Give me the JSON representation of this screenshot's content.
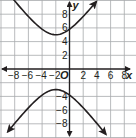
{
  "chart_data": {
    "type": "line",
    "title": "",
    "xlabel": "x",
    "ylabel": "y",
    "origin_label": "O",
    "xlim": [
      -10,
      10
    ],
    "ylim": [
      -10,
      10
    ],
    "grid": true,
    "grid_step": 2,
    "x_ticks": [
      -8,
      -6,
      -4,
      -2,
      2,
      4,
      6,
      8
    ],
    "x_tick_labels": [
      "−8",
      "−6",
      "−4",
      "−2",
      "2",
      "4",
      "6",
      "8"
    ],
    "y_ticks": [
      8,
      6,
      4,
      2,
      -4,
      -6,
      -8
    ],
    "y_tick_labels": [
      "8",
      "6",
      "4",
      "2",
      "−4",
      "−6",
      "−8"
    ],
    "series": [
      {
        "name": "hyperbola-upper-branch",
        "equation": "(y-1)^2/16 - (x+2)^2/9 = 1",
        "center": [
          -2,
          1
        ],
        "vertex": [
          -2,
          5
        ],
        "x_range": [
          -9.3,
          3.9
        ],
        "points": [
          [
            -9.3,
            9.4
          ],
          [
            -8,
            7.7
          ],
          [
            -6,
            5.8
          ],
          [
            -4,
            5.3
          ],
          [
            -2,
            5
          ],
          [
            0,
            5.8
          ],
          [
            2,
            7.7
          ],
          [
            3.9,
            9.2
          ]
        ]
      },
      {
        "name": "hyperbola-lower-branch",
        "equation": "(y-1)^2/16 - (x+2)^2/9 = 1",
        "center": [
          -2,
          1
        ],
        "vertex": [
          -2,
          -3
        ],
        "x_range": [
          -9,
          5.3
        ],
        "points": [
          [
            -9,
            -9.6
          ],
          [
            -8,
            -6.2
          ],
          [
            -6,
            -4.4
          ],
          [
            -4,
            -3.8
          ],
          [
            -2,
            -3
          ],
          [
            0,
            -3.8
          ],
          [
            2,
            -4.4
          ],
          [
            4,
            -6.2
          ],
          [
            5.3,
            -9.6
          ]
        ]
      }
    ],
    "colors": {
      "curve": "#231f20",
      "grid": "#a7a9ac",
      "axis": "#231f20"
    }
  }
}
